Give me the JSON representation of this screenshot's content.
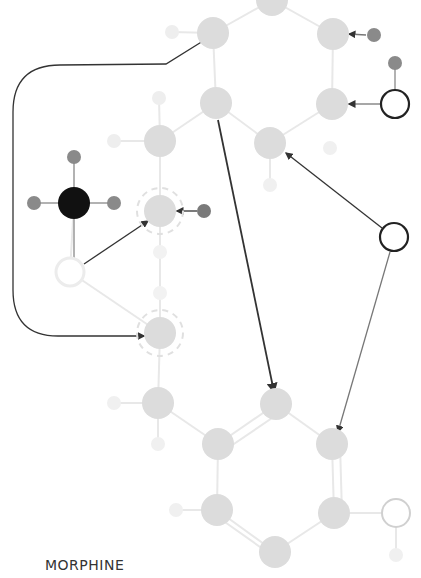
{
  "caption": "MORPHINE",
  "colors": {
    "carbon": "#dcdcdc",
    "carbon_hydrogen": "#ececec",
    "dark_hydrogen": "#8a8a8a",
    "nitrogen_center": "#111111",
    "bond_light": "#e8e8e8",
    "arrow": "#333333",
    "ring_dark": "#222222",
    "ring_light": "#d0d0d0"
  },
  "atoms": [
    {
      "id": "c-top",
      "x": 272,
      "y": 0,
      "r": 16,
      "type": "carbon"
    },
    {
      "id": "c1",
      "x": 213,
      "y": 33,
      "r": 16,
      "type": "carbon"
    },
    {
      "id": "h-c1",
      "x": 172,
      "y": 32,
      "r": 7,
      "type": "light-h"
    },
    {
      "id": "c2",
      "x": 333,
      "y": 34,
      "r": 16,
      "type": "carbon"
    },
    {
      "id": "h-c2",
      "x": 374,
      "y": 35,
      "r": 7,
      "type": "dark-h"
    },
    {
      "id": "h-o1",
      "x": 395,
      "y": 63,
      "r": 7,
      "type": "dark-h"
    },
    {
      "id": "o1",
      "x": 395,
      "y": 104,
      "r": 15,
      "type": "ring-dark"
    },
    {
      "id": "c3",
      "x": 216,
      "y": 103,
      "r": 16,
      "type": "carbon"
    },
    {
      "id": "c4",
      "x": 332,
      "y": 104,
      "r": 16,
      "type": "carbon"
    },
    {
      "id": "c5",
      "x": 160,
      "y": 141,
      "r": 16,
      "type": "carbon"
    },
    {
      "id": "h-c5a",
      "x": 114,
      "y": 141,
      "r": 7,
      "type": "light-h"
    },
    {
      "id": "h-c5b",
      "x": 159,
      "y": 98,
      "r": 7,
      "type": "light-h"
    },
    {
      "id": "c6",
      "x": 270,
      "y": 143,
      "r": 16,
      "type": "carbon"
    },
    {
      "id": "h-c6a",
      "x": 330,
      "y": 148,
      "r": 7,
      "type": "light-h"
    },
    {
      "id": "h-c6b",
      "x": 270,
      "y": 185,
      "r": 7,
      "type": "light-h"
    },
    {
      "id": "n-center",
      "x": 74,
      "y": 203,
      "r": 16,
      "type": "black"
    },
    {
      "id": "h-n-top",
      "x": 74,
      "y": 157,
      "r": 7,
      "type": "dark-h"
    },
    {
      "id": "h-n-left",
      "x": 34,
      "y": 203,
      "r": 7,
      "type": "dark-h"
    },
    {
      "id": "h-n-right",
      "x": 114,
      "y": 203,
      "r": 7,
      "type": "dark-h"
    },
    {
      "id": "c7",
      "x": 160,
      "y": 211,
      "r": 16,
      "type": "carbon-dashed"
    },
    {
      "id": "h-c7",
      "x": 204,
      "y": 211,
      "r": 7,
      "type": "dark-h"
    },
    {
      "id": "o-white",
      "x": 70,
      "y": 272,
      "r": 14,
      "type": "white"
    },
    {
      "id": "h-mid1",
      "x": 160,
      "y": 252,
      "r": 7,
      "type": "light-h"
    },
    {
      "id": "h-mid2",
      "x": 160,
      "y": 293,
      "r": 7,
      "type": "light-h"
    },
    {
      "id": "c8",
      "x": 160,
      "y": 333,
      "r": 16,
      "type": "carbon-dashed"
    },
    {
      "id": "o2",
      "x": 394,
      "y": 237,
      "r": 15,
      "type": "ring-dark"
    },
    {
      "id": "c9",
      "x": 158,
      "y": 403,
      "r": 16,
      "type": "carbon"
    },
    {
      "id": "h-c9a",
      "x": 114,
      "y": 403,
      "r": 7,
      "type": "light-h"
    },
    {
      "id": "h-c9b",
      "x": 158,
      "y": 444,
      "r": 7,
      "type": "light-h"
    },
    {
      "id": "c10",
      "x": 276,
      "y": 404,
      "r": 16,
      "type": "carbon"
    },
    {
      "id": "c11",
      "x": 218,
      "y": 444,
      "r": 16,
      "type": "carbon"
    },
    {
      "id": "c12",
      "x": 332,
      "y": 444,
      "r": 16,
      "type": "carbon"
    },
    {
      "id": "c13",
      "x": 217,
      "y": 510,
      "r": 16,
      "type": "carbon"
    },
    {
      "id": "h-c13",
      "x": 176,
      "y": 510,
      "r": 7,
      "type": "light-h"
    },
    {
      "id": "c14",
      "x": 334,
      "y": 513,
      "r": 16,
      "type": "carbon"
    },
    {
      "id": "c15",
      "x": 275,
      "y": 552,
      "r": 16,
      "type": "carbon"
    },
    {
      "id": "o3",
      "x": 396,
      "y": 513,
      "r": 15,
      "type": "ring-light"
    },
    {
      "id": "h-o3",
      "x": 396,
      "y": 555,
      "r": 7,
      "type": "light-h"
    }
  ]
}
